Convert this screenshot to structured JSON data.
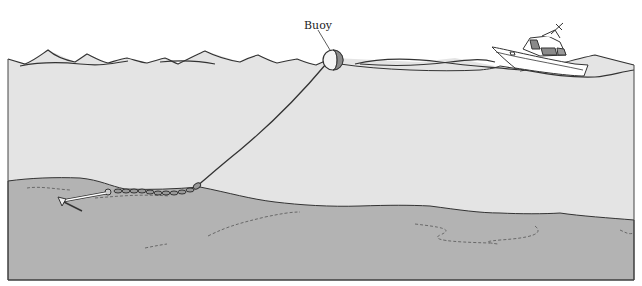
{
  "diagram": {
    "type": "illustration",
    "labels": {
      "buoy": "Buoy"
    },
    "elements": [
      "water-surface-waves",
      "boat",
      "buoy",
      "anchor-rode-line",
      "anchor-chain",
      "anchor",
      "seabed"
    ],
    "colors": {
      "water": "#e4e4e4",
      "seabed": "#b3b3b3",
      "outline": "#333333",
      "buoy_shade": "#8a8a8a",
      "background": "#ffffff"
    }
  }
}
